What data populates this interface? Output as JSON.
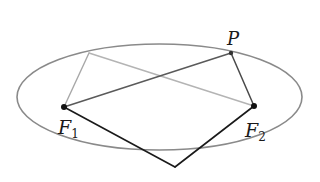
{
  "diagram": {
    "type": "ellipse-foci-construction",
    "ellipse": {
      "cx": 159.5,
      "cy": 97,
      "rx": 142.5,
      "ry": 53,
      "stroke": "#8a8a8a"
    },
    "points": {
      "F1": {
        "x": 64,
        "y": 107,
        "label": "F",
        "subscript": "1"
      },
      "F2": {
        "x": 254,
        "y": 106,
        "label": "F",
        "subscript": "2"
      },
      "P": {
        "x": 231,
        "y": 53,
        "label": "P"
      },
      "Q": {
        "x": 89,
        "y": 53
      },
      "B": {
        "x": 175,
        "y": 167
      }
    },
    "segments": [
      {
        "from": "F1",
        "to": "Q",
        "color": "#a8a8a8",
        "width": 1.4
      },
      {
        "from": "Q",
        "to": "F2",
        "color": "#b4b4b4",
        "width": 1.4
      },
      {
        "from": "F1",
        "to": "P",
        "color": "#5a5a5a",
        "width": 1.5
      },
      {
        "from": "P",
        "to": "F2",
        "color": "#4a4a4a",
        "width": 1.5
      },
      {
        "from": "F1",
        "to": "B",
        "color": "#1a1a1a",
        "width": 1.6
      },
      {
        "from": "B",
        "to": "F2",
        "color": "#1a1a1a",
        "width": 1.6
      }
    ],
    "labels": {
      "f1_main": "F",
      "f1_sub": "1",
      "f2_main": "F",
      "f2_sub": "2",
      "p": "P"
    }
  }
}
